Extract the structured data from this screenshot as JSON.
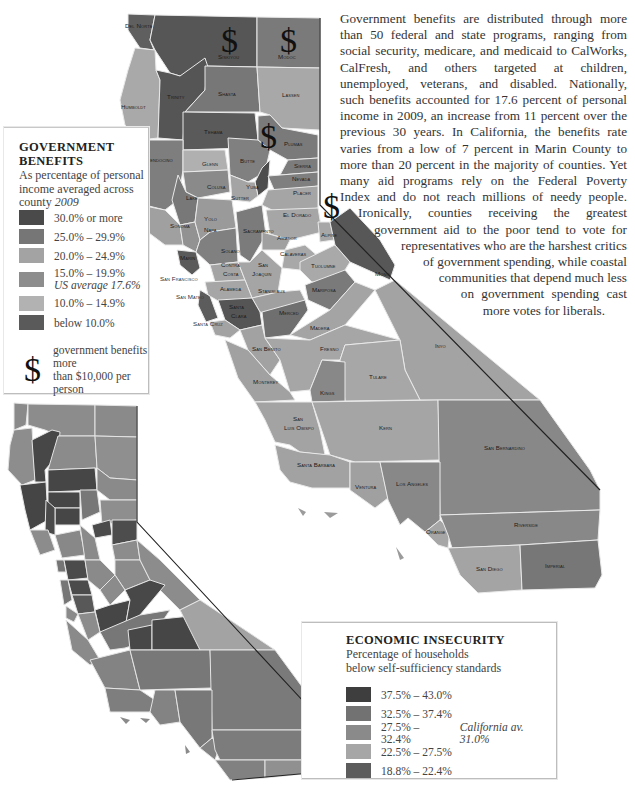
{
  "paragraph": {
    "lines": [
      "Government benefits are distributed through more",
      "than 50 federal and state programs, ranging from",
      "social security, medicare, and medicaid to CalWorks,",
      "CalFresh, and others targeted at children,",
      "unemployed, veterans, and disabled. Nationally,",
      "such benefits accounted for 17.6 percent of personal",
      "income in 2009, an increase from 11 percent over the",
      "previous 30 years. In California, the benefits rate",
      "varies from a low of 7 percent in Marin County to",
      "more than 20 percent in the majority of counties. Yet",
      "many aid programs rely on the Federal Poverty",
      "Index and do not reach millions of needy people.",
      "Ironically, counties receiving the greatest",
      "government aid to the poor tend to vote for",
      "representatives who are the harshest critics",
      "of government spending, while coastal",
      "communities that depend much less",
      "on government spending cast",
      "more votes for liberals."
    ]
  },
  "legend_benefits": {
    "title_line1": "GOVERNMENT",
    "title_line2": "BENEFITS",
    "subtitle_line1": "As percentage of personal",
    "subtitle_line2": "income averaged across",
    "subtitle_line3_prefix": "county",
    "subtitle_year": "2009",
    "items": [
      {
        "label": "30.0% or more",
        "color": "#4a4a4a"
      },
      {
        "label": "25.0% – 29.9%",
        "color": "#767676"
      },
      {
        "label": "20.0% – 24.9%",
        "color": "#a3a3a3"
      },
      {
        "label": "15.0% – 19.9%",
        "note": "US average 17.6%",
        "color": "#8d8d8d"
      },
      {
        "label": "10.0% – 14.9%",
        "color": "#b2b2b2"
      },
      {
        "label": "below 10.0%",
        "color": "#5a5a5a"
      }
    ],
    "dollar_symbol": "$",
    "dollar_note_line1": "government benefits more",
    "dollar_note_line2": "than $10,000 per person"
  },
  "legend_insecurity": {
    "title": "ECONOMIC INSECURITY",
    "subtitle_line1": "Percentage of households",
    "subtitle_line2": "below self-sufficiency standards",
    "items": [
      {
        "label": "37.5% – 43.0%",
        "color": "#3e3e3e"
      },
      {
        "label": "32.5% – 37.4%",
        "color": "#727272"
      },
      {
        "label": "27.5% – 32.4%",
        "note": "California av. 31.0%",
        "color": "#8a8a8a"
      },
      {
        "label": "22.5% – 27.5%",
        "color": "#a6a6a6"
      },
      {
        "label": "18.8% – 22.4%",
        "color": "#5c5c5c"
      }
    ]
  },
  "map_top": {
    "dollar_markers": [
      "$",
      "$",
      "$",
      "$"
    ],
    "counties": {
      "del_norte": "Del Norte",
      "siskiyou": "Siskiyou",
      "modoc": "Modoc",
      "humboldt": "Humboldt",
      "trinity": "Trinity",
      "shasta": "Shasta",
      "lassen": "Lassen",
      "tehama": "Tehama",
      "plumas": "Plumas",
      "mendocino": "Mendocino",
      "glenn": "Glenn",
      "butte": "Butte",
      "sierra": "Sierra",
      "nevada": "Nevada",
      "colusa": "Colusa",
      "lake": "Lake",
      "yuba": "Yuba",
      "sutter": "Sutter",
      "placer": "Placer",
      "sonoma": "Sonoma",
      "napa": "Napa",
      "yolo": "Yolo",
      "sacramento": "Sacramento",
      "el_dorado": "El Dorado",
      "amador": "Amador",
      "alpine": "Alpine",
      "solano": "Solano",
      "marin": "Marin",
      "calaveras": "Calaveras",
      "contra_costa_1": "Contra",
      "contra_costa_2": "Costa",
      "san_joaquin_1": "San",
      "san_joaquin_2": "Joaquin",
      "tuolumne": "Tuolumne",
      "mono": "Mono",
      "san_francisco": "San Francisco",
      "alameda": "Alameda",
      "stanislaus": "Stanislaus",
      "mariposa": "Mariposa",
      "san_mateo": "San Mateo",
      "santa_clara_1": "Santa",
      "santa_clara_2": "Clara",
      "merced": "Merced",
      "santa_cruz": "Santa Cruz",
      "madera": "Madera",
      "san_benito": "San Benito",
      "fresno": "Fresno",
      "inyo": "Inyo",
      "monterey": "Monterey",
      "tulare": "Tulare",
      "kings": "Kings",
      "san_luis_obispo_1": "San",
      "san_luis_obispo_2": "Luis Obispo",
      "kern": "Kern",
      "san_bernardino": "San Bernardino",
      "santa_barbara": "Santa Barbara",
      "ventura": "Ventura",
      "los_angeles": "Los Angeles",
      "orange": "Orange",
      "riverside": "Riverside",
      "san_diego": "San Diego",
      "imperial": "Imperial"
    }
  }
}
